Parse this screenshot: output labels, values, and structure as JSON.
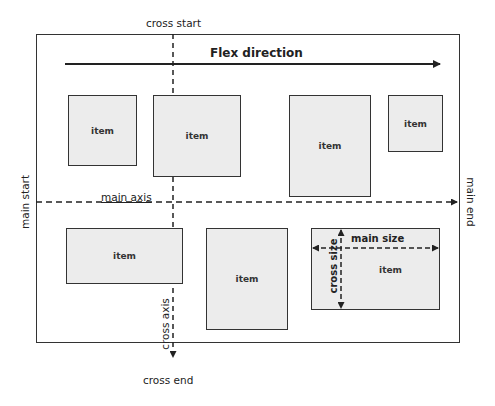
{
  "diagram": {
    "title": "Flex direction",
    "container_label": "container",
    "labels": {
      "cross_start": "cross start",
      "cross_end": "cross end",
      "main_start": "main start",
      "main_end": "main end",
      "main_axis": "main axis",
      "cross_axis": "cross axis",
      "main_size": "main size",
      "cross_size": "cross size"
    },
    "items": [
      {
        "label": "item"
      },
      {
        "label": "item"
      },
      {
        "label": "item"
      },
      {
        "label": "item"
      },
      {
        "label": "item"
      },
      {
        "label": "item"
      },
      {
        "label": "item"
      }
    ],
    "colors": {
      "item_fill": "#ececec",
      "stroke": "#333333",
      "background": "#ffffff"
    }
  }
}
